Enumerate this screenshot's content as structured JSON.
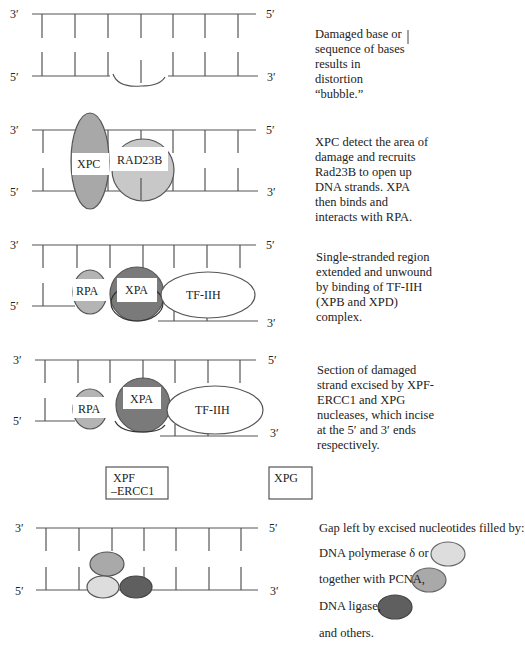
{
  "colors": {
    "strand": "#555555",
    "xpc": "#a8a8a8",
    "rad23b": "#c8c8c8",
    "rpa": "#b4b4b4",
    "xpa": "#7a7a7a",
    "pol_delta": "#dddddd",
    "pcna": "#a9a9a9",
    "ligase": "#5f5f5f"
  },
  "ends": {
    "three_prime": "3′",
    "five_prime": "5′"
  },
  "steps": [
    {
      "id": "damage",
      "description": "Damaged base or sequence of bases results in distortion “bubble.”"
    },
    {
      "id": "recognition",
      "proteins": [
        "XPC",
        "RAD23B"
      ],
      "description": "XPC detect the area of damage and recruits Rad23B to open up DNA strands. XPA then binds and interacts with RPA."
    },
    {
      "id": "unwinding",
      "proteins": [
        "RPA",
        "XPA",
        "TF-IIH"
      ],
      "description": "Single-stranded region extended and unwound by binding of TF-IIH (XPB and XPD) complex."
    },
    {
      "id": "excision",
      "proteins": [
        "RPA",
        "XPA",
        "TF-IIH"
      ],
      "description": "Section of damaged strand excised by XPF-ERCC1 and XPG nucleases, which incise at the 5′ and 3′ ends respectively."
    },
    {
      "id": "gap-filling",
      "description": "Gap left by excised nucleotides filled by:"
    }
  ],
  "nucleases": {
    "xpf_line1": "XPF",
    "xpf_line2": "–ERCC1",
    "xpg": "XPG"
  },
  "labels": {
    "xpc": "XPC",
    "rad23b": "RAD23B",
    "rpa": "RPA",
    "xpa": "XPA",
    "tfiih": "TF-IIH"
  },
  "legend": [
    {
      "label": "DNA polymerase δ or",
      "color_key": "pol_delta"
    },
    {
      "label": "together with PCNA,",
      "color_key": "pcna"
    },
    {
      "label": "DNA ligase,",
      "color_key": "ligase"
    },
    {
      "label": "and others.",
      "color_key": null
    }
  ]
}
